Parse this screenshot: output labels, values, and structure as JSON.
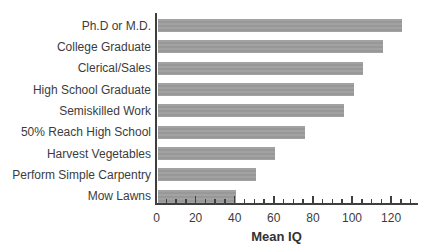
{
  "chart_data": {
    "type": "bar",
    "orientation": "horizontal",
    "title": "",
    "xlabel": "Mean IQ",
    "ylabel": "",
    "categories": [
      "Ph.D or M.D.",
      "College Graduate",
      "Clerical/Sales",
      "High School Graduate",
      "Semiskilled Work",
      "50% Reach High School",
      "Harvest Vegetables",
      "Perform Simple Carpentry",
      "Mow Lawns"
    ],
    "values": [
      125,
      115,
      105,
      100,
      95,
      75,
      60,
      50,
      40
    ],
    "xlim": [
      0,
      133
    ],
    "x_major_ticks": [
      0,
      20,
      40,
      60,
      80,
      100,
      120
    ],
    "x_minor_tick_step": 5,
    "x_minor_tick_max": 130,
    "grid": false,
    "legend": null,
    "bar_color": "#9c9c9c",
    "axis_color": "#3f3f3f",
    "text_color": "#3c3c3c"
  }
}
